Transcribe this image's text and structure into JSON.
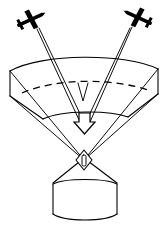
{
  "figure": {
    "background_color": "#ffffff",
    "line_color": "#000000",
    "width_px": 168,
    "height_px": 227
  },
  "elements": {
    "aircraft_left": {
      "name": "left-aircraft",
      "label": "",
      "position": {
        "x": 30,
        "y": 20
      },
      "rotation_deg": -25
    },
    "aircraft_right": {
      "name": "right-aircraft",
      "label": "",
      "position": {
        "x": 139,
        "y": 18
      },
      "rotation_deg": 25
    },
    "beam_left": {
      "name": "left-beam",
      "label": ""
    },
    "beam_right": {
      "name": "right-beam",
      "label": ""
    },
    "swath_band": {
      "name": "curved-swath-band",
      "label": ""
    },
    "centerline": {
      "name": "swath-centerline",
      "label": "",
      "style": "dashed"
    },
    "convergence_arrow": {
      "name": "downward-convergence-arrow",
      "label": "",
      "direction": "down"
    },
    "target_marker": {
      "name": "diamond-target-marker",
      "label": ""
    },
    "ground_cone": {
      "name": "ground-station-cone",
      "label": ""
    },
    "ground_cylinder": {
      "name": "ground-station-cylinder",
      "label": ""
    }
  },
  "annotations": []
}
